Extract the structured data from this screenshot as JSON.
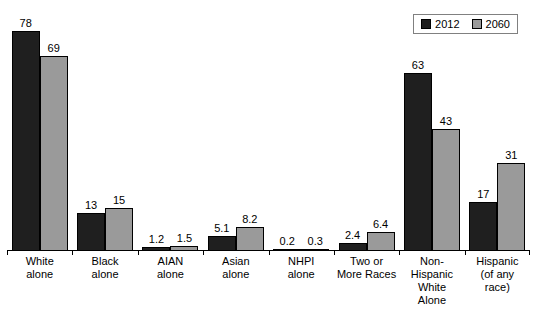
{
  "chart_data": {
    "type": "bar",
    "categories": [
      "White alone",
      "Black alone",
      "AIAN alone",
      "Asian alone",
      "NHPI alone",
      "Two or More Races",
      "Non-Hispanic White Alone",
      "Hispanic (of any race)"
    ],
    "category_label_lines": [
      [
        "White",
        "alone"
      ],
      [
        "Black",
        "alone"
      ],
      [
        "AIAN",
        "alone"
      ],
      [
        "Asian",
        "alone"
      ],
      [
        "NHPI",
        "alone"
      ],
      [
        "Two or",
        "More Races"
      ],
      [
        "Non-Hispanic",
        "White",
        "Alone"
      ],
      [
        "Hispanic",
        "(of any",
        "race)"
      ]
    ],
    "series": [
      {
        "name": "2012",
        "color": "#1f1f1f",
        "values": [
          78,
          13,
          1.2,
          5.1,
          0.2,
          2.4,
          63,
          17
        ]
      },
      {
        "name": "2060",
        "color": "#9a9a9a",
        "values": [
          69,
          15,
          1.5,
          8.2,
          0.3,
          6.4,
          43,
          31
        ]
      }
    ],
    "value_labels": [
      [
        "78",
        "13",
        "1.2",
        "5.1",
        "0.2",
        "2.4",
        "63",
        "17"
      ],
      [
        "69",
        "15",
        "1.5",
        "8.2",
        "0.3",
        "6.4",
        "43",
        "31"
      ]
    ],
    "title": "",
    "xlabel": "",
    "ylabel": "",
    "ylim": [
      0,
      80
    ],
    "grid": false,
    "legend_position": "top-right",
    "bar_border_color": "#000000",
    "axis_color": "#000000"
  },
  "legend": {
    "items": [
      {
        "label": "2012",
        "color": "#1f1f1f"
      },
      {
        "label": "2060",
        "color": "#9a9a9a"
      }
    ]
  }
}
